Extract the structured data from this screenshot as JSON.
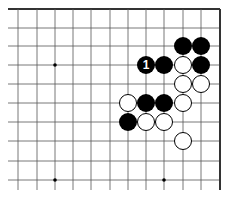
{
  "board": {
    "colors": {
      "line": "#555555",
      "border": "#333333",
      "black": "#000000",
      "white": "#ffffff"
    },
    "columns_x": [
      18,
      37,
      55,
      73,
      91,
      110,
      128,
      146,
      164,
      183,
      201,
      220
    ],
    "rows_y": [
      9,
      28,
      46,
      65,
      84,
      103,
      122,
      141,
      161,
      180
    ],
    "line_bottom": 190,
    "star_points": [
      [
        2,
        3
      ],
      [
        2,
        9
      ],
      [
        8,
        9
      ]
    ],
    "stones": [
      {
        "color": "black",
        "col": 9,
        "row": 2,
        "label": ""
      },
      {
        "color": "black",
        "col": 10,
        "row": 2,
        "label": ""
      },
      {
        "color": "black",
        "col": 7,
        "row": 3,
        "label": "1"
      },
      {
        "color": "black",
        "col": 8,
        "row": 3,
        "label": ""
      },
      {
        "color": "black",
        "col": 10,
        "row": 3,
        "label": ""
      },
      {
        "color": "black",
        "col": 7,
        "row": 5,
        "label": ""
      },
      {
        "color": "black",
        "col": 8,
        "row": 5,
        "label": ""
      },
      {
        "color": "black",
        "col": 6,
        "row": 6,
        "label": ""
      },
      {
        "color": "white",
        "col": 9,
        "row": 3,
        "label": ""
      },
      {
        "color": "white",
        "col": 9,
        "row": 4,
        "label": ""
      },
      {
        "color": "white",
        "col": 10,
        "row": 4,
        "label": ""
      },
      {
        "color": "white",
        "col": 6,
        "row": 5,
        "label": ""
      },
      {
        "color": "white",
        "col": 9,
        "row": 5,
        "label": ""
      },
      {
        "color": "white",
        "col": 7,
        "row": 6,
        "label": ""
      },
      {
        "color": "white",
        "col": 8,
        "row": 6,
        "label": ""
      },
      {
        "color": "white",
        "col": 9,
        "row": 7,
        "label": ""
      }
    ]
  }
}
